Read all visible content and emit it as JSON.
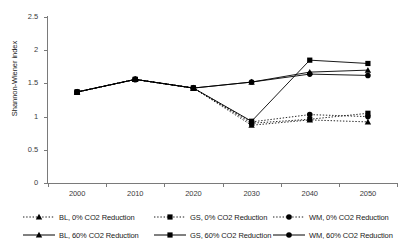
{
  "chart_data": {
    "type": "line",
    "title": "",
    "xlabel": "",
    "ylabel": "Shannon-Wiener index",
    "categories": [
      "2000",
      "2010",
      "2020",
      "2030",
      "2040",
      "2050"
    ],
    "x": [
      2000,
      2010,
      2020,
      2030,
      2040,
      2050
    ],
    "ylim": [
      0,
      2.5
    ],
    "y_ticks": [
      "0",
      "0.5",
      "1",
      "1.5",
      "2",
      "2.5"
    ],
    "y_tick_values": [
      0,
      0.5,
      1,
      1.5,
      2,
      2.5
    ],
    "grid": false,
    "legend_position": "bottom",
    "series": [
      {
        "name": "BL, 0% CO2 Reduction",
        "key": "bl_0",
        "marker": "triangle",
        "line_style": "dotted",
        "color": "#000000",
        "values": [
          1.37,
          1.56,
          1.43,
          0.87,
          0.95,
          0.92
        ]
      },
      {
        "name": "GS, 0% CO2 Reduction",
        "key": "gs_0",
        "marker": "square",
        "line_style": "dotted",
        "color": "#000000",
        "values": [
          1.37,
          1.56,
          1.43,
          0.9,
          0.96,
          1.05
        ]
      },
      {
        "name": "WM, 0% CO2 Reduction",
        "key": "wm_0",
        "marker": "circle",
        "line_style": "dotted",
        "color": "#000000",
        "values": [
          1.37,
          1.56,
          1.43,
          0.92,
          1.03,
          1.0
        ]
      },
      {
        "name": "BL, 60% CO2 Reduction",
        "key": "bl_60",
        "marker": "triangle",
        "line_style": "solid",
        "color": "#000000",
        "values": [
          1.37,
          1.56,
          1.43,
          1.52,
          1.67,
          1.7
        ]
      },
      {
        "name": "GS, 60% CO2 Reduction",
        "key": "gs_60",
        "marker": "square",
        "line_style": "solid",
        "color": "#000000",
        "values": [
          1.37,
          1.56,
          1.43,
          0.93,
          1.85,
          1.8
        ]
      },
      {
        "name": "WM, 60% CO2 Reduction",
        "key": "wm_60",
        "marker": "circle",
        "line_style": "solid",
        "color": "#000000",
        "values": [
          1.37,
          1.56,
          1.43,
          1.52,
          1.64,
          1.62
        ]
      }
    ]
  },
  "legend": {
    "rows": [
      [
        {
          "label": "BL, 0% CO2 Reduction",
          "marker": "triangle",
          "line_style": "dotted"
        },
        {
          "label": "GS, 0% CO2 Reduction",
          "marker": "square",
          "line_style": "dotted"
        },
        {
          "label": "WM, 0% CO2 Reduction",
          "marker": "circle",
          "line_style": "dotted"
        }
      ],
      [
        {
          "label": "BL, 60% CO2 Reduction",
          "marker": "triangle",
          "line_style": "solid"
        },
        {
          "label": "GS, 60% CO2 Reduction",
          "marker": "square",
          "line_style": "solid"
        },
        {
          "label": "WM, 60% CO2 Reduction",
          "marker": "circle",
          "line_style": "solid"
        }
      ]
    ]
  },
  "axes": {
    "y_title": "Shannon-Wiener index",
    "axis_color": "#7a7a7a",
    "label_color": "#3b3b3b"
  }
}
